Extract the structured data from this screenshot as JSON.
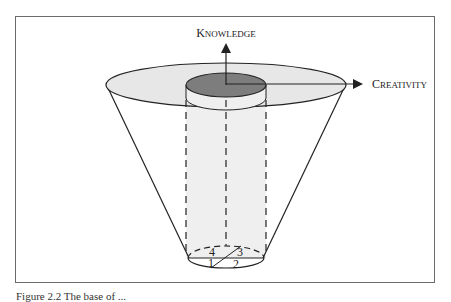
{
  "figure": {
    "axes": {
      "vertical": {
        "label_first": "K",
        "label_rest": "NOWLEDGE",
        "label": "Knowledge"
      },
      "horizontal": {
        "label_first": "C",
        "label_rest": "REATIVITY",
        "label": "Creativity"
      }
    },
    "quadrants": [
      "1",
      "2",
      "3",
      "4"
    ],
    "caption": "Figure 2.2 The base of ..."
  },
  "colors": {
    "frame": "#6a6a6a",
    "top_disk_fill": "#e6e6e6",
    "inner_disk_fill": "#7d7d7d",
    "cylinder_fill": "#efefef",
    "stroke": "#222222"
  }
}
